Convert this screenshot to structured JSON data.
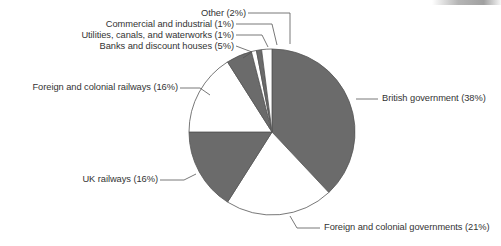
{
  "chart_data": {
    "type": "pie",
    "title": "",
    "subtitle": "",
    "xlabel": "",
    "ylabel": "",
    "legend_position": "none",
    "grid": false,
    "label_format": "{name} ({value}%)",
    "start_angle_deg": 0,
    "direction": "clockwise",
    "categories": [
      "British government",
      "Foreign and colonial governments",
      "UK railways",
      "Foreign and colonial railways",
      "Banks and discount houses",
      "Utilities, canals, and waterworks",
      "Commercial and industrial",
      "Other"
    ],
    "values": [
      38,
      21,
      16,
      16,
      5,
      1,
      1,
      2
    ],
    "slices": [
      {
        "name": "British government",
        "value": 38,
        "label": "British government (38%)",
        "fill": "#6b6b6b",
        "label_position": "right"
      },
      {
        "name": "Foreign and colonial governments",
        "value": 21,
        "label": "Foreign and colonial governments (21%)",
        "fill": "#ffffff",
        "label_position": "bottom-right"
      },
      {
        "name": "UK railways",
        "value": 16,
        "label": "UK railways (16%)",
        "fill": "#6b6b6b",
        "label_position": "left-lower"
      },
      {
        "name": "Foreign and colonial railways",
        "value": 16,
        "label": "Foreign and colonial railways (16%)",
        "fill": "#ffffff",
        "label_position": "left-upper"
      },
      {
        "name": "Banks and discount houses",
        "value": 5,
        "label": "Banks and discount houses (5%)",
        "fill": "#6b6b6b",
        "label_position": "top"
      },
      {
        "name": "Utilities, canals, and waterworks",
        "value": 1,
        "label": "Utilities, canals, and waterworks (1%)",
        "fill": "#ffffff",
        "label_position": "top"
      },
      {
        "name": "Commercial and industrial",
        "value": 1,
        "label": "Commercial and industrial (1%)",
        "fill": "#6b6b6b",
        "label_position": "top"
      },
      {
        "name": "Other",
        "value": 2,
        "label": "Other (2%)",
        "fill": "#ffffff",
        "label_position": "top"
      }
    ],
    "colors": {
      "dark_slice": "#6b6b6b",
      "light_slice": "#ffffff",
      "outline": "#555555",
      "leader_line": "#555555",
      "text": "#333333",
      "background": "#ffffff"
    },
    "geometry": {
      "center_x": 272,
      "center_y": 132,
      "radius": 83
    }
  }
}
